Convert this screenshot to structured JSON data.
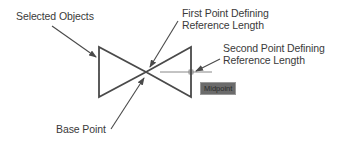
{
  "diagram": {
    "type": "cad-scale-reference-illustration",
    "labels": {
      "selected_objects": "Selected Objects",
      "first_point_line1": "First Point Defining",
      "first_point_line2": "Reference Length",
      "second_point_line1": "Second Point Defining",
      "second_point_line2": "Reference Length",
      "base_point": "Base Point"
    },
    "snap_tooltip": "Midpoint",
    "colors": {
      "background": "#ffffff",
      "lines": "#4a4a4a",
      "text": "#3a3a3a",
      "tooltip_fill": "#6b6b6b"
    },
    "shape": {
      "name": "bowtie",
      "left_edge_x": 99,
      "right_edge_x": 191,
      "top_y": 47,
      "bottom_y": 97,
      "center": [
        146,
        72
      ]
    }
  }
}
